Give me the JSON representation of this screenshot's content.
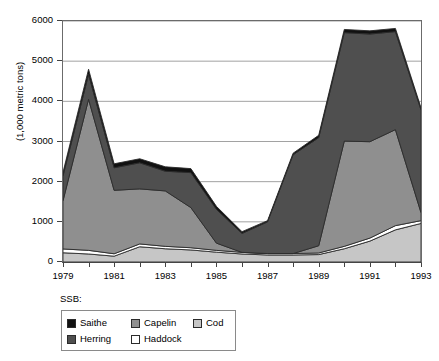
{
  "chart_data": {
    "type": "area",
    "stacked": true,
    "title": "",
    "subtitle": "",
    "xlabel": "",
    "ylabel": "(1,000 metric tons)",
    "legend_title": "SSB:",
    "legend_position": "bottom-left",
    "grid": true,
    "x": [
      1979,
      1980,
      1981,
      1982,
      1983,
      1984,
      1985,
      1986,
      1987,
      1988,
      1989,
      1990,
      1991,
      1992,
      1993
    ],
    "xlim": [
      1979,
      1993
    ],
    "ylim": [
      0,
      6000
    ],
    "x_tick_labels": [
      "1979",
      "1981",
      "1983",
      "1985",
      "1987",
      "1989",
      "1991",
      "1993"
    ],
    "x_tick_values": [
      1979,
      1981,
      1983,
      1985,
      1987,
      1989,
      1991,
      1993
    ],
    "y_tick_labels": [
      "0",
      "1000",
      "2000",
      "3000",
      "4000",
      "5000",
      "6000"
    ],
    "y_tick_values": [
      0,
      1000,
      2000,
      3000,
      4000,
      5000,
      6000
    ],
    "stack_order_bottom_to_top": [
      "Cod",
      "Haddock",
      "Capelin",
      "Herring",
      "Saithe"
    ],
    "series": [
      {
        "name": "Cod",
        "color": "#c6c6c6",
        "values": [
          230,
          200,
          145,
          380,
          330,
          300,
          245,
          200,
          175,
          175,
          185,
          330,
          520,
          800,
          960
        ]
      },
      {
        "name": "Haddock",
        "color": "#ffffff",
        "values": [
          95,
          90,
          60,
          70,
          60,
          55,
          45,
          40,
          35,
          35,
          40,
          60,
          75,
          105,
          70
        ]
      },
      {
        "name": "Capelin",
        "color": "#8f8f8f",
        "values": [
          1200,
          3760,
          1580,
          1370,
          1380,
          1000,
          180,
          0,
          0,
          0,
          180,
          2620,
          2400,
          2390,
          200
        ]
      },
      {
        "name": "Herring",
        "color": "#4f4f4f",
        "values": [
          620,
          620,
          560,
          650,
          490,
          870,
          840,
          470,
          790,
          2460,
          2690,
          2700,
          2680,
          2440,
          2560
        ]
      },
      {
        "name": "Saithe",
        "color": "#111111",
        "values": [
          90,
          130,
          100,
          100,
          110,
          100,
          75,
          45,
          30,
          40,
          60,
          80,
          80,
          80,
          50
        ]
      }
    ],
    "totals": [
      2235,
      4800,
      2445,
      2570,
      2370,
      2325,
      1385,
      755,
      1030,
      2710,
      3155,
      5790,
      5755,
      5815,
      3840
    ]
  },
  "legend": {
    "title": "SSB:",
    "entries": [
      {
        "label": "Saithe",
        "color": "#111111"
      },
      {
        "label": "Capelin",
        "color": "#8f8f8f"
      },
      {
        "label": "Cod",
        "color": "#c6c6c6"
      },
      {
        "label": "Herring",
        "color": "#4f4f4f"
      },
      {
        "label": "Haddock",
        "color": "#ffffff"
      }
    ]
  },
  "axes": {
    "y_title": "(1,000 metric tons)"
  },
  "colors": {
    "grid": "#8a8a8a",
    "axis": "#444444",
    "frame": "#6b6b6b",
    "background": "#ffffff"
  }
}
